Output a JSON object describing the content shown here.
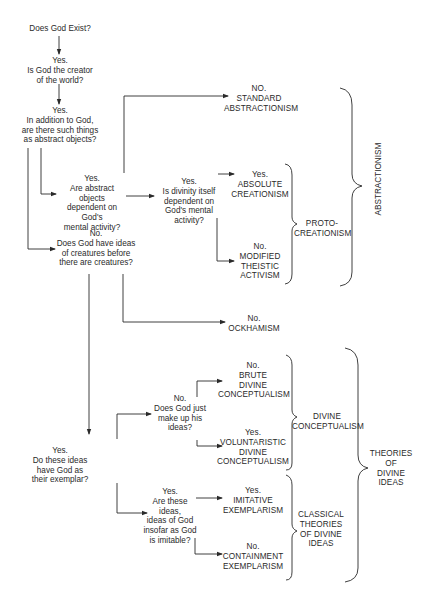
{
  "diagram": {
    "questions": {
      "q1": "Does God Exist?",
      "q2": "Yes.\nIs God the creator\nof the world?",
      "q3": "Yes.\nIn addition to God,\nare there such things\nas abstract objects?",
      "q4": "Yes.\nAre abstract objects\ndependent on\nGod's\nmental activity?",
      "q5": "Yes.\nIs divinity itself\ndependent on\nGod's mental\nactivity?",
      "q6": "No.\nDoes God have ideas\nof creatures before\nthere are creatures?",
      "q7": "Yes.\nDo these ideas\nhave God as\ntheir exemplar?",
      "q8": "No.\nDoes God just\nmake up his\nideas?",
      "q9": "Yes.\nAre these\nideas,\nideas of God\ninsofar as God\nis imitable?"
    },
    "outcomes": {
      "standard_abstractionism": "NO.\nSTANDARD\nABSTRACTIONISM",
      "absolute_creationism": "Yes.\nABSOLUTE\nCREATIONISM",
      "modified_theistic_activism": "No.\nMODIFIED\nTHEISTIC\nACTIVISM",
      "ockhamism": "No.\nOCKHAMISM",
      "brute_divine_conceptualism": "No.\nBRUTE\nDIVINE\nCONCEPTUALISM",
      "voluntaristic_divine_conceptualism": "Yes.\nVOLUNTARISTIC\nDIVINE\nCONCEPTUALISM",
      "imitative_exemplarism": "Yes.\nIMITATIVE\nEXEMPLARISM",
      "containment_exemplarism": "No.\nCONTAINMENT\nEXEMPLARISM"
    },
    "groups": {
      "proto_creationism": "PROTO-\nCREATIONISM",
      "abstractionism": "ABSTRACTIONISM",
      "divine_conceptualism": "DIVINE\nCONCEPTUALISM",
      "classical_theories": "CLASSICAL\nTHEORIES\nOF DIVINE\nIDEAS",
      "theories_of_divine_ideas": "THEORIES\nOF\nDIVINE\nIDEAS"
    },
    "colors": {
      "line": "#2a2a2a",
      "text": "#2a2a2a",
      "background": "#ffffff"
    }
  }
}
